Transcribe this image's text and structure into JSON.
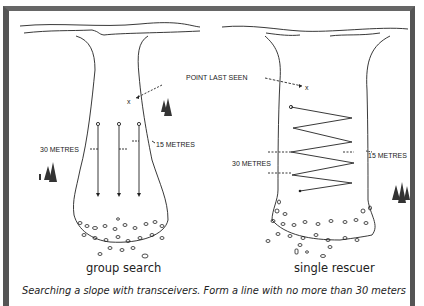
{
  "diagram": {
    "left_panel": {
      "caption": "group search",
      "label_30": "30 METRES",
      "label_15": "15 METRES"
    },
    "right_panel": {
      "caption": "single rescuer",
      "label_point": "POINT LAST SEEN",
      "label_30": "30 METRES",
      "label_15": "15 METRES",
      "marker": "x"
    },
    "left_marker": "x",
    "footer_text": "Searching a slope with transceivers. Form a line with no more than 30 meters"
  }
}
